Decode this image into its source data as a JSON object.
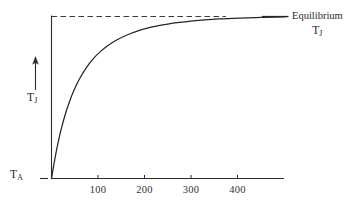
{
  "figure": {
    "background_color": "#ffffff",
    "ink_color": "#262626"
  },
  "chart_data": {
    "type": "line",
    "title": "",
    "xlabel": "",
    "ylabel": "T_J",
    "xlim": [
      0,
      500
    ],
    "ylim": [
      0,
      1
    ],
    "grid": false,
    "legend_position": "right-inline",
    "y_axis": {
      "arrow_direction": "up",
      "axis_label": "T",
      "axis_label_subscript": "J",
      "baseline_label": "T",
      "baseline_label_subscript": "A",
      "baseline_tick_mark": true,
      "ticks_shown": false,
      "tick_labels": []
    },
    "x_axis": {
      "ticks": [
        100,
        200,
        300,
        400
      ],
      "tick_labels": [
        "100",
        "200",
        "300",
        "400"
      ],
      "axis_start": 0,
      "axis_end": 500
    },
    "annotations": [
      {
        "name": "equilibrium-label",
        "line1": "Equilibrium",
        "line2_symbol": "T",
        "line2_subscript": "J",
        "leader_line": true
      },
      {
        "name": "asymptote",
        "style": "dashed",
        "y_value": 1.0,
        "x_from": 0,
        "x_to": 375,
        "description": "dashed horizontal asymptote at equilibrium temperature"
      }
    ],
    "series": [
      {
        "name": "junction-temperature-rise",
        "style": "solid",
        "color": "#262626",
        "description": "exponential saturation toward equilibrium",
        "x": [
          0,
          5,
          10,
          15,
          20,
          30,
          40,
          50,
          60,
          75,
          90,
          105,
          120,
          140,
          160,
          180,
          200,
          225,
          250,
          275,
          300,
          330,
          360,
          390,
          420,
          450,
          480,
          500
        ],
        "y": [
          0.0,
          0.085,
          0.163,
          0.232,
          0.295,
          0.4,
          0.485,
          0.555,
          0.614,
          0.685,
          0.74,
          0.783,
          0.818,
          0.855,
          0.883,
          0.905,
          0.923,
          0.94,
          0.953,
          0.963,
          0.971,
          0.979,
          0.985,
          0.989,
          0.992,
          0.994,
          0.996,
          0.997
        ]
      }
    ]
  }
}
